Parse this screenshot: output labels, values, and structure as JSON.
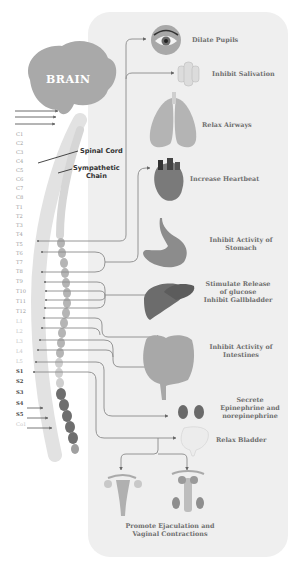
{
  "diagram": {
    "brain_label": "BRAIN",
    "spinal_cord_label": "Spinal Cord",
    "sympathetic_chain_label": [
      "Sympathetic",
      "Chain"
    ],
    "vertebrae": {
      "cervical": [
        "C1",
        "C2",
        "C3",
        "C4",
        "C5",
        "C6",
        "C7",
        "C8"
      ],
      "thoracic": [
        "T1",
        "T2",
        "T3",
        "T4",
        "T5",
        "T6",
        "T7",
        "T8",
        "T9",
        "T10",
        "T11",
        "T12"
      ],
      "lumbar": [
        "L1",
        "L2",
        "L3",
        "L4",
        "L5"
      ],
      "sacral": [
        "S1",
        "S2",
        "S3",
        "S4",
        "S5"
      ],
      "coccygeal": [
        "Co1"
      ]
    },
    "effects": [
      {
        "organ": "eye",
        "icon": "eye-icon",
        "label": "Dilate Pupils"
      },
      {
        "organ": "salivary-gland",
        "icon": "salivary-gland-icon",
        "label": "Inhibit Salivation"
      },
      {
        "organ": "lungs",
        "icon": "lungs-icon",
        "label": "Relax Airways"
      },
      {
        "organ": "heart",
        "icon": "heart-icon",
        "label": "Increase Heartbeat"
      },
      {
        "organ": "stomach",
        "icon": "stomach-icon",
        "label": [
          "Inhibit Activity of",
          "Stomach"
        ]
      },
      {
        "organ": "liver",
        "icon": "liver-icon",
        "label": [
          "Stimulate Release",
          "of glucose",
          "Inhibit Gallbladder"
        ]
      },
      {
        "organ": "intestines",
        "icon": "intestines-icon",
        "label": [
          "Inhibit Activity of",
          "Intestines"
        ]
      },
      {
        "organ": "kidneys",
        "icon": "kidneys-icon",
        "label": [
          "Secrete",
          "Epinephrine and",
          "norepinephrine"
        ]
      },
      {
        "organ": "bladder",
        "icon": "bladder-icon",
        "label": "Relax Bladder"
      },
      {
        "organ": "reproductive",
        "icon": "reproductive-organs-icon",
        "label": [
          "Promote Ejaculation and",
          "Vaginal Contractions"
        ]
      }
    ],
    "colors": {
      "panel": "#efefef",
      "brain": "#a9a9a9",
      "cord": "#dcdcdc",
      "chain_thoracic": "#b0b0b0",
      "chain_sacral": "#6a6a6a",
      "lines": "#8a8a8a",
      "text": "#6d6d6d"
    }
  }
}
